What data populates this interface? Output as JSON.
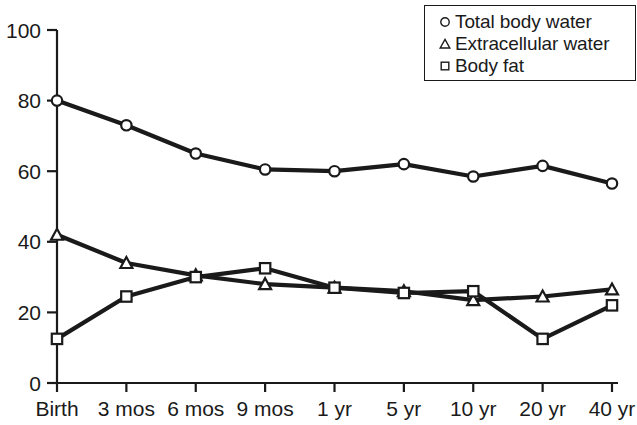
{
  "chart_data": {
    "type": "line",
    "title": "",
    "xlabel": "",
    "ylabel": "",
    "categories": [
      "Birth",
      "3 mos",
      "6 mos",
      "9 mos",
      "1 yr",
      "5 yr",
      "10 yr",
      "20 yr",
      "40 yr"
    ],
    "ylim": [
      0,
      100
    ],
    "yticks": [
      0,
      20,
      40,
      60,
      80,
      100
    ],
    "grid": false,
    "legend_position": "top-right",
    "series": [
      {
        "name": "Total body water",
        "marker": "circle-marker",
        "values": [
          80,
          73,
          65,
          60.5,
          60,
          62,
          58.5,
          61.5,
          56.5
        ]
      },
      {
        "name": "Extracellular water",
        "marker": "triangle-marker",
        "values": [
          42,
          34,
          30.5,
          28,
          27,
          26,
          23.5,
          24.5,
          26.5
        ]
      },
      {
        "name": "Body fat",
        "marker": "square-marker",
        "values": [
          12.5,
          24.5,
          30,
          32.5,
          27,
          25.5,
          26,
          12.5,
          22
        ]
      }
    ]
  },
  "axes": {
    "ytick_labels": [
      "100",
      "80",
      "60",
      "40",
      "20",
      "0"
    ],
    "xtick_labels": [
      "Birth",
      "3 mos",
      "6 mos",
      "9 mos",
      "1 yr",
      "5 yr",
      "10 yr",
      "20 yr",
      "40 yr"
    ]
  },
  "legend": {
    "entries": [
      {
        "marker": "circle-marker",
        "label": "Total body water"
      },
      {
        "marker": "triangle-marker",
        "label": "Extracellular water"
      },
      {
        "marker": "square-marker",
        "label": "Body fat"
      }
    ]
  },
  "style": {
    "line_color": "#1a1a1a",
    "marker_fill": "#ffffff",
    "axis_color": "#1a1a1a",
    "background": "#ffffff"
  }
}
